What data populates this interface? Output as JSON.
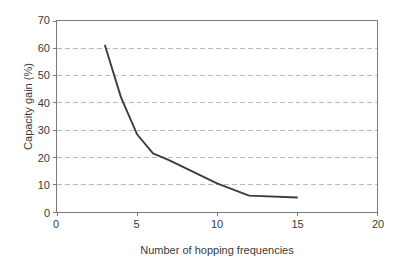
{
  "chart_data": {
    "type": "line",
    "title": "",
    "xlabel": "Number of hopping frequencies",
    "ylabel": "Capacity gain (%)",
    "xlim": [
      0,
      20
    ],
    "ylim": [
      0,
      70
    ],
    "xticks": [
      0,
      5,
      10,
      15,
      20
    ],
    "yticks": [
      0,
      10,
      20,
      30,
      40,
      50,
      60,
      70
    ],
    "xtick_labels": [
      "0",
      "5",
      "10",
      "15",
      "20"
    ],
    "ytick_labels": [
      "0",
      "10",
      "20",
      "30",
      "40",
      "50",
      "60",
      "70"
    ],
    "grid": {
      "horizontal": true,
      "vertical": false,
      "style": "dashed",
      "color": "#b9b9b9"
    },
    "legend": null,
    "series": [
      {
        "name": "Capacity gain",
        "color": "#3d3d3d",
        "x": [
          3,
          4,
          5,
          6,
          7,
          10,
          12,
          15
        ],
        "values": [
          61,
          42,
          28.5,
          21.5,
          19,
          10.5,
          6,
          5.3
        ]
      }
    ]
  },
  "axes": {
    "y_title": "Capacity gain (%)",
    "x_title": "Number of hopping frequencies"
  },
  "colors": {
    "line": "#3d3d3d",
    "grid": "#b9b9b9",
    "frame": "#7a7a7a",
    "text": "#3a3a3a",
    "background": "#ffffff"
  }
}
